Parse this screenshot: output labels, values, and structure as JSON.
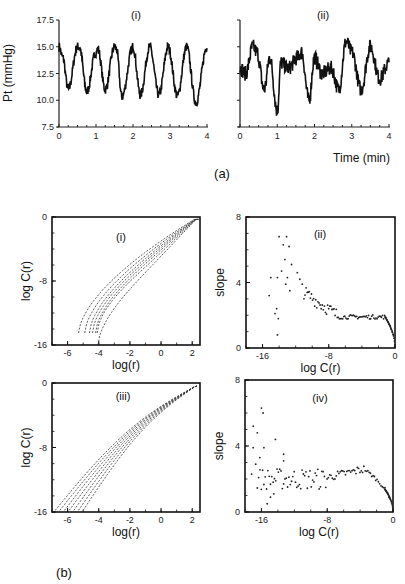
{
  "figure": {
    "part_a_label": "(a)",
    "part_b_label": "(b)"
  },
  "chart_data": [
    {
      "id": "a-i",
      "type": "line",
      "title": "(i)",
      "xlabel": "",
      "ylabel": "Pt (mmHg)",
      "xlim": [
        0,
        4
      ],
      "ylim": [
        7.5,
        17.5
      ],
      "xticks": [
        "0",
        "1",
        "2",
        "3",
        "4"
      ],
      "yticks": [
        "7.5",
        "10.0",
        "12.5",
        "15.0",
        "17.5"
      ],
      "grid": false,
      "description": "Regular periodic oscillation, ~8.5 cycles over 4 min",
      "x": [
        0,
        0.1,
        0.25,
        0.5,
        0.55,
        0.75,
        1.0,
        1.05,
        1.25,
        1.5,
        1.55,
        1.7,
        2.0,
        2.2,
        2.45,
        2.7,
        2.95,
        3.2,
        3.45,
        3.7,
        4.0
      ],
      "y": [
        15.0,
        14.0,
        11.0,
        15.0,
        15.0,
        10.8,
        14.5,
        14.8,
        11.0,
        15.0,
        14.8,
        10.3,
        15.0,
        10.5,
        15.0,
        10.5,
        15.0,
        10.4,
        15.0,
        9.8,
        15.0
      ]
    },
    {
      "id": "a-ii",
      "type": "line",
      "title": "(ii)",
      "xlabel": "Time (min)",
      "ylabel": "",
      "xlim": [
        0,
        4
      ],
      "ylim": [
        7.5,
        17.5
      ],
      "xticks": [
        "0",
        "1",
        "2",
        "3",
        "4"
      ],
      "grid": false,
      "description": "Irregular fluctuating signal",
      "x": [
        0,
        0.15,
        0.35,
        0.45,
        0.65,
        0.8,
        1.0,
        1.1,
        1.3,
        1.55,
        1.65,
        1.85,
        2.0,
        2.2,
        2.45,
        2.65,
        2.85,
        3.0,
        3.25,
        3.5,
        3.75,
        4.0
      ],
      "y": [
        13.0,
        12.5,
        15.0,
        14.5,
        11.0,
        14.0,
        9.0,
        13.5,
        13.0,
        14.0,
        14.5,
        10.0,
        14.0,
        12.5,
        13.0,
        11.0,
        15.5,
        14.5,
        11.0,
        15.0,
        12.0,
        13.5
      ]
    },
    {
      "id": "b-i",
      "type": "line",
      "title": "(i)",
      "xlabel": "log(r)",
      "ylabel": "log C(r)",
      "xlim": [
        -7,
        2.5
      ],
      "ylim": [
        -16,
        0
      ],
      "xticks": [
        "-6",
        "-4",
        "-2",
        "0",
        "2"
      ],
      "yticks": [
        "-16",
        "-8",
        "0"
      ],
      "grid": false,
      "description": "Family of correlation integral curves (dotted), converging at top right",
      "series_count": 7
    },
    {
      "id": "b-ii",
      "type": "scatter",
      "title": "(ii)",
      "xlabel": "log C(r)",
      "ylabel": "slope",
      "xlim": [
        -18,
        0
      ],
      "ylim": [
        0,
        8
      ],
      "xticks": [
        "-16",
        "-8",
        "0"
      ],
      "yticks": [
        "0",
        "4",
        "8"
      ],
      "grid": false,
      "description": "Local slopes: scattered high values (up to ~7) at low log C(r), plateau ~2 from -8 to -1, dropping to 0 at 0"
    },
    {
      "id": "b-iii",
      "type": "line",
      "title": "(iii)",
      "xlabel": "log(r)",
      "ylabel": "log C(r)",
      "xlim": [
        -7,
        2.5
      ],
      "ylim": [
        -16,
        0
      ],
      "xticks": [
        "-6",
        "-4",
        "-2",
        "0",
        "2"
      ],
      "yticks": [
        "-16",
        "-8",
        "0"
      ],
      "grid": false,
      "description": "Family of nearly straight parallel dotted curves",
      "series_count": 7
    },
    {
      "id": "b-iv",
      "type": "scatter",
      "title": "(iv)",
      "xlabel": "log C(r)",
      "ylabel": "slope",
      "xlim": [
        -18,
        0
      ],
      "ylim": [
        0,
        8
      ],
      "xticks": [
        "-16",
        "-8",
        "0"
      ],
      "yticks": [
        "0",
        "4",
        "8"
      ],
      "grid": false,
      "description": "Local slopes: scatter at low log C(r), rising to ~2.5 around -4, then falling to 0"
    }
  ]
}
